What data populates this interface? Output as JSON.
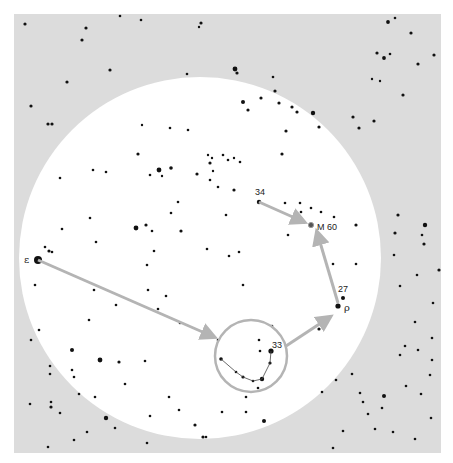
{
  "diagram": {
    "type": "star-hopping finder chart",
    "background_color": "#dcdcdc",
    "field_color": "#ffffff",
    "star_color": "#111111",
    "arrow_color": "#b4b4b4",
    "field_circle": {
      "cx": 200,
      "cy": 258,
      "r": 181
    },
    "eyepiece_circle": {
      "cx": 251,
      "cy": 356,
      "r": 36
    },
    "labels": [
      {
        "id": "epsilon",
        "text": "ε",
        "x": 31,
        "y": 262
      },
      {
        "id": "rho",
        "text": "ρ",
        "x": 345,
        "y": 310
      },
      {
        "id": "star-27",
        "text": "27",
        "x": 339,
        "y": 290
      },
      {
        "id": "star-33",
        "text": "33",
        "x": 272,
        "y": 347
      },
      {
        "id": "star-34",
        "text": "34",
        "x": 255,
        "y": 196
      },
      {
        "id": "m60",
        "text": "M 60",
        "x": 317,
        "y": 229
      }
    ],
    "arrows": [
      {
        "from": [
          38,
          260
        ],
        "to": [
          214,
          337
        ]
      },
      {
        "from": [
          259,
          202
        ],
        "to": [
          304,
          222
        ]
      },
      {
        "from": [
          338,
          303
        ],
        "to": [
          317,
          232
        ]
      },
      {
        "from": [
          286,
          346
        ],
        "to": [
          330,
          317
        ]
      }
    ],
    "asterism_line": [
      [
        221,
        359
      ],
      [
        236,
        372
      ],
      [
        243,
        377
      ],
      [
        253,
        381
      ],
      [
        262,
        379
      ],
      [
        270,
        363
      ],
      [
        271,
        351
      ]
    ],
    "stars": [
      [
        25,
        24,
        1.6
      ],
      [
        86,
        28,
        1.6
      ],
      [
        82,
        40,
        1.6
      ],
      [
        201,
        23,
        1.6
      ],
      [
        199,
        27,
        1.2
      ],
      [
        388,
        22,
        1.9
      ],
      [
        235,
        69,
        2.4
      ],
      [
        237,
        73,
        1.6
      ],
      [
        187,
        74,
        1.3
      ],
      [
        273,
        77,
        1.3
      ],
      [
        390,
        54,
        1.3
      ],
      [
        377,
        53,
        1.6
      ],
      [
        384,
        58,
        1.9
      ],
      [
        31,
        106,
        1.6
      ],
      [
        48,
        124,
        1.6
      ],
      [
        52,
        124,
        1.6
      ],
      [
        67,
        82,
        1.6
      ],
      [
        110,
        70,
        1.6
      ],
      [
        243,
        102,
        2.0
      ],
      [
        261,
        98,
        1.6
      ],
      [
        248,
        110,
        1.6
      ],
      [
        275,
        91,
        1.6
      ],
      [
        279,
        103,
        1.6
      ],
      [
        292,
        107,
        1.6
      ],
      [
        297,
        112,
        1.6
      ],
      [
        286,
        131,
        1.6
      ],
      [
        282,
        154,
        1.6
      ],
      [
        313,
        113,
        2.2
      ],
      [
        319,
        127,
        1.6
      ],
      [
        353,
        117,
        1.6
      ],
      [
        359,
        128,
        1.6
      ],
      [
        374,
        121,
        1.6
      ],
      [
        403,
        95,
        1.6
      ],
      [
        372,
        79,
        1.2
      ],
      [
        380,
        81,
        1.2
      ],
      [
        418,
        64,
        1.6
      ],
      [
        434,
        55,
        1.6
      ],
      [
        411,
        33,
        1.6
      ],
      [
        142,
        125,
        1.2
      ],
      [
        170,
        128,
        1.3
      ],
      [
        188,
        130,
        1.3
      ],
      [
        138,
        154,
        1.6
      ],
      [
        159,
        170,
        2.4
      ],
      [
        171,
        168,
        1.8
      ],
      [
        162,
        176,
        1.2
      ],
      [
        197,
        174,
        1.6
      ],
      [
        208,
        155,
        1.2
      ],
      [
        212,
        158,
        1.2
      ],
      [
        210,
        163,
        1.6
      ],
      [
        213,
        171,
        1.2
      ],
      [
        223,
        155,
        1.3
      ],
      [
        228,
        160,
        1.3
      ],
      [
        234,
        158,
        1.2
      ],
      [
        240,
        162,
        1.3
      ],
      [
        234,
        190,
        1.6
      ],
      [
        259,
        202,
        2.2
      ],
      [
        285,
        203,
        1.3
      ],
      [
        300,
        203,
        1.3
      ],
      [
        301,
        212,
        1.3
      ],
      [
        321,
        212,
        1.3
      ],
      [
        304,
        222,
        1.6
      ],
      [
        311,
        208,
        1.3
      ],
      [
        226,
        215,
        1.3
      ],
      [
        288,
        235,
        1.3
      ],
      [
        334,
        217,
        1.3
      ],
      [
        356,
        225,
        1.6
      ],
      [
        333,
        264,
        1.3
      ],
      [
        356,
        264,
        1.3
      ],
      [
        343,
        298,
        2.0
      ],
      [
        338,
        306,
        2.6
      ],
      [
        60,
        178,
        1.3
      ],
      [
        93,
        170,
        1.3
      ],
      [
        106,
        172,
        1.3
      ],
      [
        136,
        228,
        2.4
      ],
      [
        146,
        225,
        1.6
      ],
      [
        150,
        175,
        1.3
      ],
      [
        90,
        218,
        1.3
      ],
      [
        152,
        231,
        1.3
      ],
      [
        171,
        213,
        1.3
      ],
      [
        178,
        202,
        1.3
      ],
      [
        154,
        251,
        1.3
      ],
      [
        181,
        231,
        1.6
      ],
      [
        210,
        180,
        1.3
      ],
      [
        218,
        187,
        1.3
      ],
      [
        62,
        229,
        1.3
      ],
      [
        96,
        242,
        1.3
      ],
      [
        147,
        265,
        1.3
      ],
      [
        207,
        249,
        1.3
      ],
      [
        229,
        256,
        1.3
      ],
      [
        239,
        252,
        1.3
      ],
      [
        243,
        285,
        1.3
      ],
      [
        45,
        247,
        1.3
      ],
      [
        49,
        251,
        1.6
      ],
      [
        38,
        260,
        4.0
      ],
      [
        52,
        252,
        1.3
      ],
      [
        35,
        285,
        1.3
      ],
      [
        39,
        330,
        1.3
      ],
      [
        94,
        290,
        1.3
      ],
      [
        116,
        305,
        1.3
      ],
      [
        148,
        290,
        1.3
      ],
      [
        166,
        296,
        1.3
      ],
      [
        180,
        323,
        1.3
      ],
      [
        158,
        309,
        1.3
      ],
      [
        72,
        350,
        2.0
      ],
      [
        100,
        360,
        2.4
      ],
      [
        119,
        362,
        1.6
      ],
      [
        145,
        361,
        1.3
      ],
      [
        72,
        370,
        1.3
      ],
      [
        74,
        377,
        1.3
      ],
      [
        79,
        394,
        1.3
      ],
      [
        50,
        366,
        1.3
      ],
      [
        50,
        374,
        1.3
      ],
      [
        89,
        320,
        1.3
      ],
      [
        51,
        402,
        1.3
      ],
      [
        51,
        407,
        1.6
      ],
      [
        31,
        340,
        1.3
      ],
      [
        95,
        397,
        1.3
      ],
      [
        169,
        397,
        1.3
      ],
      [
        125,
        384,
        1.3
      ],
      [
        150,
        416,
        1.3
      ],
      [
        179,
        410,
        1.3
      ],
      [
        195,
        425,
        1.6
      ],
      [
        203,
        437,
        1.6
      ],
      [
        206,
        437,
        1.3
      ],
      [
        222,
        412,
        1.3
      ],
      [
        246,
        397,
        1.3
      ],
      [
        246,
        412,
        1.3
      ],
      [
        264,
        421,
        2.0
      ],
      [
        272,
        326,
        1.3
      ],
      [
        259,
        340,
        1.3
      ],
      [
        260,
        351,
        1.3
      ],
      [
        218,
        340,
        1.3
      ],
      [
        221,
        359,
        1.8
      ],
      [
        236,
        372,
        1.3
      ],
      [
        243,
        377,
        1.6
      ],
      [
        253,
        381,
        1.3
      ],
      [
        262,
        379,
        2.2
      ],
      [
        270,
        363,
        1.6
      ],
      [
        271,
        351,
        2.6
      ],
      [
        258,
        388,
        1.3
      ],
      [
        319,
        329,
        1.6
      ],
      [
        336,
        380,
        1.3
      ],
      [
        322,
        392,
        1.3
      ],
      [
        352,
        374,
        1.3
      ],
      [
        360,
        393,
        1.3
      ],
      [
        363,
        402,
        1.3
      ],
      [
        384,
        396,
        2.0
      ],
      [
        382,
        408,
        1.3
      ],
      [
        393,
        432,
        1.3
      ],
      [
        375,
        429,
        1.3
      ],
      [
        343,
        431,
        1.3
      ],
      [
        368,
        414,
        1.3
      ],
      [
        406,
        386,
        1.3
      ],
      [
        418,
        350,
        1.3
      ],
      [
        421,
        394,
        1.3
      ],
      [
        394,
        255,
        1.3
      ],
      [
        398,
        215,
        1.6
      ],
      [
        395,
        233,
        1.6
      ],
      [
        425,
        225,
        2.2
      ],
      [
        422,
        235,
        1.3
      ],
      [
        424,
        244,
        1.6
      ],
      [
        439,
        270,
        1.6
      ],
      [
        417,
        275,
        1.3
      ],
      [
        400,
        286,
        1.3
      ],
      [
        433,
        303,
        1.3
      ],
      [
        415,
        322,
        1.3
      ],
      [
        405,
        346,
        1.3
      ],
      [
        400,
        355,
        1.3
      ],
      [
        432,
        338,
        1.3
      ],
      [
        432,
        360,
        1.3
      ],
      [
        430,
        375,
        1.3
      ],
      [
        431,
        418,
        1.3
      ],
      [
        30,
        404,
        1.3
      ],
      [
        60,
        413,
        1.3
      ],
      [
        106,
        418,
        2.2
      ],
      [
        115,
        428,
        1.3
      ],
      [
        147,
        443,
        1.3
      ],
      [
        169,
        455,
        1.6
      ],
      [
        87,
        432,
        1.3
      ],
      [
        74,
        440,
        1.3
      ],
      [
        48,
        447,
        1.3
      ],
      [
        415,
        439,
        1.3
      ],
      [
        333,
        448,
        1.3
      ],
      [
        395,
        18,
        1.3
      ],
      [
        120,
        16,
        1.3
      ],
      [
        141,
        20,
        1.3
      ]
    ]
  }
}
